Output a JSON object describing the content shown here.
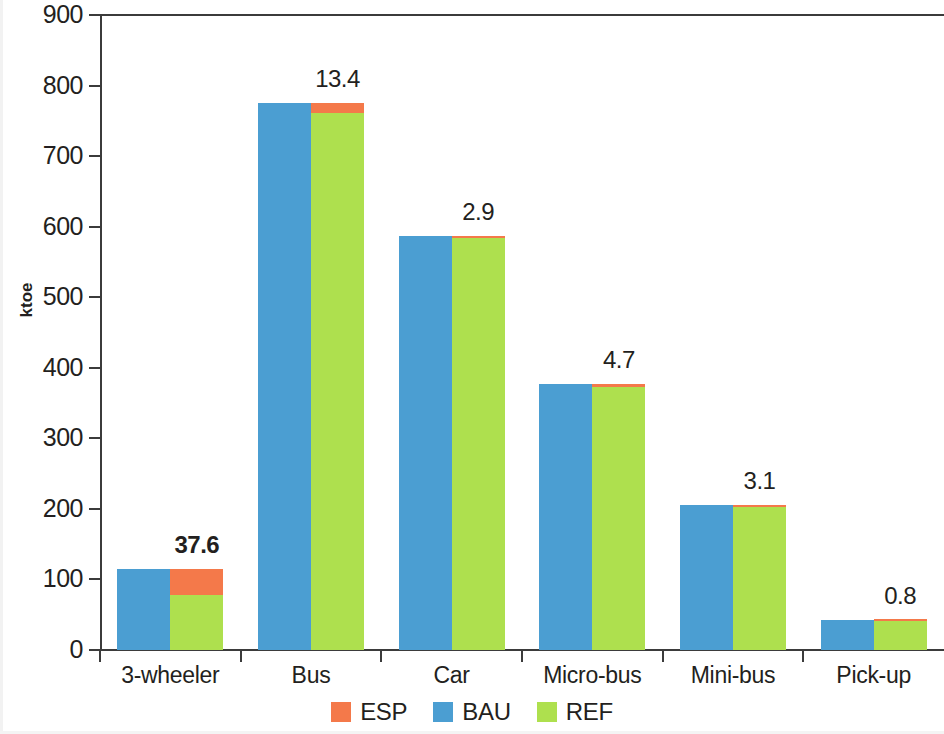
{
  "chart_data": {
    "type": "bar",
    "title": "",
    "subtitle": "",
    "xlabel": "",
    "ylabel": "ktoe",
    "ylim": [
      0,
      900
    ],
    "ytick_step": 100,
    "ytick_labels": [
      "900",
      "800",
      "700",
      "600",
      "500",
      "400",
      "300",
      "200",
      "100",
      "0"
    ],
    "grid": false,
    "legend_position": "bottom-center",
    "grouping": "BAU bar beside stacked REF+ESP bar",
    "categories": [
      "3-wheeler",
      "Bus",
      "Car",
      "Micro-bus",
      "Mini-bus",
      "Pick-up"
    ],
    "series": [
      {
        "name": "ESP",
        "color": "#f4794a",
        "values": [
          37.6,
          13.4,
          2.9,
          4.7,
          3.1,
          0.8
        ]
      },
      {
        "name": "BAU",
        "color": "#4b9ed2",
        "values": [
          115.0,
          775.0,
          587.0,
          377.0,
          206.0,
          42.0
        ]
      },
      {
        "name": "REF",
        "color": "#aee04e",
        "values": [
          77.4,
          761.6,
          584.1,
          372.3,
          202.9,
          41.2
        ]
      }
    ],
    "data_labels": [
      "37.6",
      "13.4",
      "2.9",
      "4.7",
      "3.1",
      "0.8"
    ],
    "data_labels_meaning": "ESP increment shown above each stacked bar",
    "data_label_bold": [
      true,
      false,
      false,
      false,
      false,
      false
    ],
    "legend": [
      {
        "label": "ESP",
        "color": "#f4794a"
      },
      {
        "label": "BAU",
        "color": "#4b9ed2"
      },
      {
        "label": "REF",
        "color": "#aee04e"
      }
    ]
  }
}
